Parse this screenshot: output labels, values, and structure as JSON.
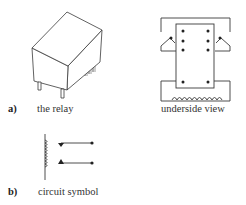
{
  "figure": {
    "part_a": {
      "letter": "a)",
      "relay_caption": "the relay",
      "underside_caption": "underside view"
    },
    "part_b": {
      "letter": "b)",
      "symbol_caption": "circuit symbol"
    }
  },
  "colors": {
    "line": "#3a3a3a",
    "background": "#ffffff"
  }
}
